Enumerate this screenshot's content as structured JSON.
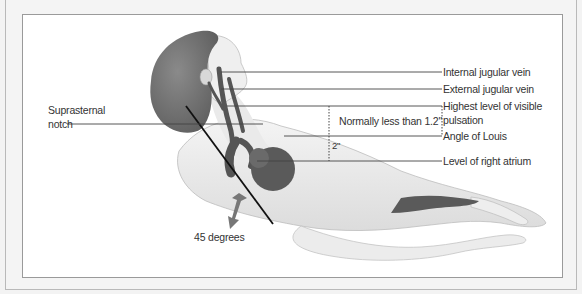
{
  "figure": {
    "labels": {
      "internal_jugular": "Internal jugular vein",
      "external_jugular": "External jugular vein",
      "highest_level_line1": "Highest level of visible",
      "highest_level_line2": "pulsation",
      "angle_of_louis": "Angle of Louis",
      "right_atrium": "Level of right atrium",
      "suprasternal_line1": "Suprasternal",
      "suprasternal_line2": "notch",
      "normal_range": "Normally  less than 1.2\"",
      "distance_2in": "2\"",
      "angle": "45 degrees"
    },
    "colors": {
      "organ": "#5a5a5a",
      "skin": "#e8e8e8",
      "line": "#444444",
      "hair": "#777777"
    }
  }
}
